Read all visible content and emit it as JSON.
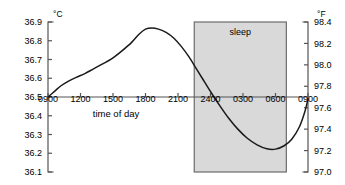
{
  "chart_data": {
    "type": "line",
    "title": "",
    "subtitle": "",
    "xlabel": "time of day",
    "ylabel": "°C",
    "y2label": "°F",
    "grid": false,
    "legend_position": "none",
    "x_tick_labels": [
      "0900",
      "1200",
      "1500",
      "1800",
      "2100",
      "2400",
      "0300",
      "0600",
      "0900"
    ],
    "x_tick_hours": [
      9,
      12,
      15,
      18,
      21,
      24,
      27,
      30,
      33
    ],
    "xlim": [
      9,
      33
    ],
    "ylim": [
      36.1,
      36.9
    ],
    "y_tick_labels": [
      "36.9",
      "36.8",
      "36.7",
      "36.6",
      "36.5",
      "36.4",
      "36.3",
      "36.2",
      "36.1"
    ],
    "y_tick_values": [
      36.9,
      36.8,
      36.7,
      36.6,
      36.5,
      36.4,
      36.3,
      36.2,
      36.1
    ],
    "y2lim": [
      97.0,
      98.4
    ],
    "y2_tick_labels": [
      "98.4",
      "98.2",
      "98.0",
      "97.8",
      "97.6",
      "97.4",
      "97.2",
      "97.0"
    ],
    "y2_tick_values": [
      98.4,
      98.2,
      98.0,
      97.8,
      97.6,
      97.4,
      97.2,
      97.0
    ],
    "baseline_value": 36.5,
    "annotations": [
      {
        "label": "sleep",
        "type": "shaded-region",
        "x_start_hour": 22.5,
        "x_end_hour": 31.0,
        "x_start_label": "2230",
        "x_end_label": "0700",
        "fill_color": "#d9d9d9",
        "border_color": "#6b6b6b"
      }
    ],
    "series": [
      {
        "name": "body temperature",
        "color": "#1a1a1a",
        "x": [
          9.0,
          9.6,
          10.2,
          10.9,
          11.6,
          12.4,
          13.2,
          14.0,
          14.9,
          15.8,
          16.7,
          17.4,
          18.0,
          18.6,
          19.2,
          19.9,
          20.6,
          21.3,
          22.0,
          22.7,
          23.4,
          24.1,
          24.9,
          25.7,
          26.5,
          27.4,
          28.3,
          29.2,
          30.0,
          30.8,
          31.5,
          32.2,
          32.7,
          33.0
        ],
        "y": [
          36.5,
          36.53,
          36.56,
          36.585,
          36.605,
          36.625,
          36.65,
          36.675,
          36.705,
          36.745,
          36.79,
          36.835,
          36.862,
          36.868,
          36.862,
          36.845,
          36.815,
          36.77,
          36.715,
          36.65,
          36.585,
          36.52,
          36.45,
          36.385,
          36.33,
          36.28,
          36.245,
          36.224,
          36.222,
          36.24,
          36.275,
          36.34,
          36.42,
          36.49
        ]
      }
    ]
  },
  "axes": {
    "left_unit": "°C",
    "right_unit": "°F"
  }
}
